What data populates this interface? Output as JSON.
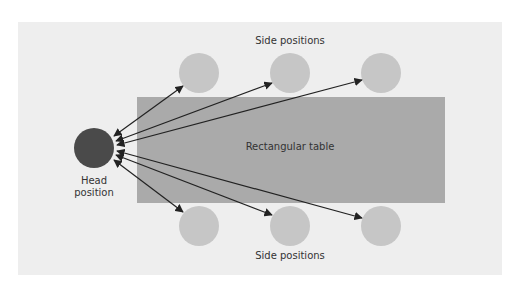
{
  "diagram": {
    "labels": {
      "top_side": "Side positions",
      "bottom_side": "Side positions",
      "table": "Rectangular table",
      "head_line1": "Head",
      "head_line2": "position"
    },
    "colors": {
      "background": "#eeeeee",
      "table": "#aaaaaa",
      "side_seat": "#c6c6c6",
      "head_seat": "#4a4a4a",
      "arrow": "#222222"
    }
  }
}
